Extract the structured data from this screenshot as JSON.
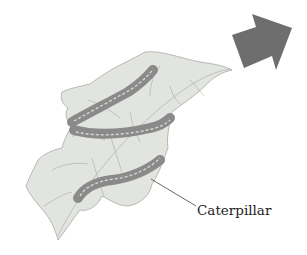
{
  "diagram": {
    "labels": [
      {
        "text": "Caterpillar",
        "x": 197,
        "y": 202
      }
    ],
    "arrow": {
      "direction": "up-right",
      "color": "#6e6e6e"
    },
    "colors": {
      "leaf_fill": "#e2e4df",
      "leaf_vein": "#9a9c98",
      "caterpillar_body": "#8a8a8a",
      "caterpillar_stripe": "#d6d6d6",
      "leader_line": "#444444"
    }
  }
}
